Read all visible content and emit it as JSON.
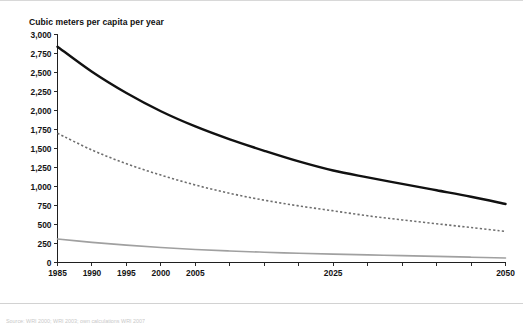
{
  "figure": {
    "background_color": "#ffffff",
    "border_color": "#d8d8d8"
  },
  "axis_title": "Cubic meters per capita per year",
  "chart_data": {
    "type": "line",
    "title": "",
    "subtitle": "",
    "xlabel": "",
    "ylabel": "Cubic meters per capita per year",
    "xlim": [
      1985,
      2050
    ],
    "ylim": [
      0,
      3000
    ],
    "grid": false,
    "legend_position": "bottom",
    "x_tick_labels": [
      "1985",
      "1990",
      "1995",
      "2000",
      "2005",
      "2025",
      "2050"
    ],
    "x_tick_values": [
      1985,
      1990,
      1995,
      2000,
      2005,
      2025,
      2050
    ],
    "x_minor_ticks": [
      1985,
      1990,
      1995,
      2000,
      2005,
      2010,
      2015,
      2020,
      2025,
      2030,
      2035,
      2040,
      2045,
      2050
    ],
    "y_tick_labels": [
      "3,000",
      "2,750",
      "2,500",
      "2,250",
      "2,000",
      "1,750",
      "1,500",
      "1,250",
      "1,000",
      "750",
      "500",
      "250",
      "0"
    ],
    "y_tick_values": [
      3000,
      2750,
      2500,
      2250,
      2000,
      1750,
      1500,
      1250,
      1000,
      750,
      500,
      250,
      0
    ],
    "x": [
      1985,
      1990,
      1995,
      2000,
      2005,
      2010,
      2015,
      2020,
      2025,
      2030,
      2035,
      2040,
      2045,
      2050
    ],
    "series": [
      {
        "name": "Middle East",
        "style": "dotted",
        "color": "#6e6e6e",
        "width": 1.6,
        "values": [
          1700,
          1480,
          1300,
          1150,
          1020,
          910,
          820,
          745,
          680,
          615,
          560,
          510,
          460,
          410
        ]
      },
      {
        "name": "Mashriq",
        "style": "solid",
        "color": "#111111",
        "width": 2.4,
        "values": [
          2840,
          2510,
          2230,
          1990,
          1790,
          1620,
          1470,
          1330,
          1210,
          1120,
          1035,
          950,
          865,
          770
        ]
      },
      {
        "name": "Arabian Peninsula",
        "style": "solid",
        "color": "#a0a0a0",
        "width": 1.6,
        "values": [
          310,
          265,
          228,
          197,
          172,
          152,
          135,
          121,
          110,
          100,
          90,
          80,
          70,
          60
        ]
      }
    ]
  },
  "legend": {
    "items": [
      {
        "label": "Middle East",
        "marker": "dotted-line",
        "color": "#6e6e6e"
      },
      {
        "label": "Mashriq",
        "marker": "thick-solid-line",
        "color": "#111111"
      },
      {
        "label": "Arabian Peninsula",
        "marker": "solid-line",
        "color": "#a0a0a0"
      }
    ]
  },
  "source_note": "Source: WRI 2000; WRI 2003; own calculations WRI 2007"
}
